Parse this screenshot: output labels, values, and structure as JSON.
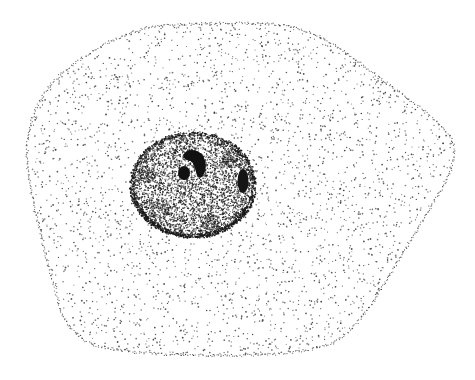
{
  "figure": {
    "caption": "",
    "colors": {
      "background": "#ffffff",
      "ink": "#1a1a1a",
      "cytoplasm_dot": "#3a3a3a",
      "nucleus_dot": "#202020",
      "nucleolus": "#111111"
    },
    "parts": {
      "cell_body": "cytoplasm (sparse stipple)",
      "nucleus": "nucleus (dense stipple, darker rim)",
      "nucleoli": [
        "crescent nucleolus",
        "round nucleolus",
        "peripheral chromatin patch"
      ]
    }
  }
}
